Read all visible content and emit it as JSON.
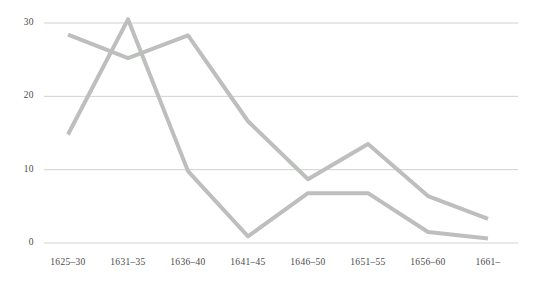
{
  "chart_data": {
    "type": "line",
    "title": "",
    "subtitle": "",
    "xlabel": "",
    "ylabel": "",
    "categories": [
      "1625–30",
      "1631–35",
      "1636–40",
      "1641–45",
      "1646–50",
      "1651–55",
      "1656–60",
      "1661–"
    ],
    "yticks": [
      0,
      10,
      20,
      30
    ],
    "ylim": [
      0,
      31
    ],
    "grid": "horizontal",
    "legend": "none",
    "series": [
      {
        "name": "series-1",
        "color": "#bcbfbc",
        "values": [
          28.4,
          25.2,
          28.3,
          16.6,
          8.7,
          13.5,
          6.4,
          3.3
        ]
      },
      {
        "name": "series-2",
        "color": "#bcbfbc",
        "values": [
          14.8,
          30.5,
          9.8,
          0.9,
          6.8,
          6.8,
          1.5,
          0.6
        ]
      }
    ]
  },
  "axes": {
    "y_tick_labels": [
      "0",
      "10",
      "20",
      "30"
    ],
    "x_tick_labels": [
      "1625–30",
      "1631–35",
      "1636–40",
      "1641–45",
      "1646–50",
      "1651–55",
      "1656–60",
      "1661–"
    ]
  },
  "style": {
    "gridline_color": "#cfd2cf",
    "line_color": "#bcbfbc",
    "background": "#ffffff",
    "text_color": "#4a4a4a",
    "line_width": 4
  }
}
